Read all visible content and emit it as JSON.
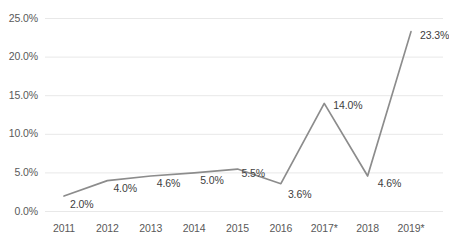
{
  "chart_data": {
    "type": "line",
    "title": "",
    "subtitle": "",
    "xlabel": "",
    "ylabel": "",
    "categories": [
      "2011",
      "2012",
      "2013",
      "2014",
      "2015",
      "2016",
      "2017*",
      "2018",
      "2019*"
    ],
    "values": [
      2.0,
      4.0,
      4.6,
      5.0,
      5.5,
      3.6,
      14.0,
      4.6,
      23.3
    ],
    "data_labels": [
      "2.0%",
      "4.0%",
      "4.6%",
      "5.0%",
      "5.5%",
      "3.6%",
      "14.0%",
      "4.6%",
      "23.3%"
    ],
    "ylim": [
      0,
      25
    ],
    "ytick_values": [
      0,
      5,
      10,
      15,
      20,
      25
    ],
    "ytick_labels": [
      "0.0%",
      "5.0%",
      "10.0%",
      "15.0%",
      "20.0%",
      "25.0%"
    ],
    "grid": true,
    "grid_axis": "y",
    "legend": false,
    "legend_position": "none",
    "series": [
      {
        "name": "",
        "values": [
          2.0,
          4.0,
          4.6,
          5.0,
          5.5,
          3.6,
          14.0,
          4.6,
          23.3
        ]
      }
    ],
    "colors": {
      "line": "#8c8c8c",
      "grid": "#e8e8e8",
      "tick_text": "#595959",
      "label_text": "#404040",
      "background": "#ffffff"
    }
  }
}
